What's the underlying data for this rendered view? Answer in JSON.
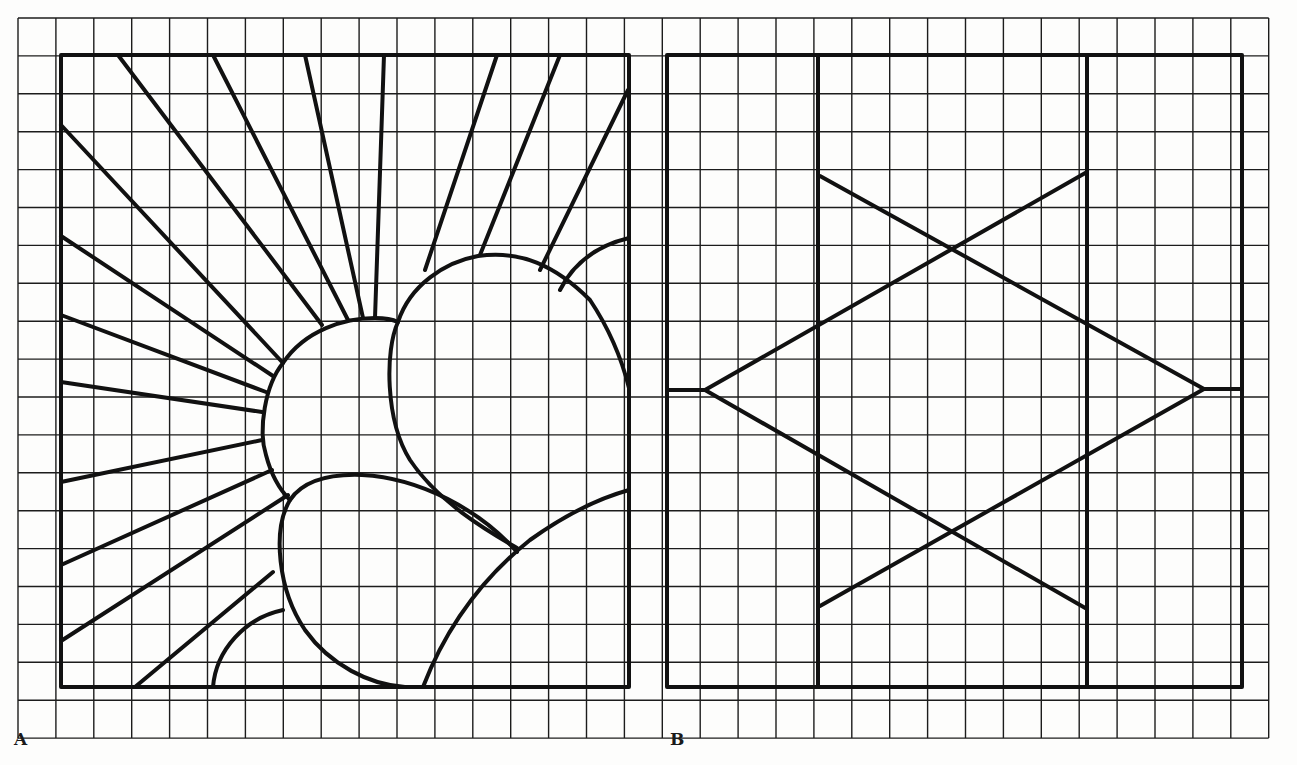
{
  "figure": {
    "colors": {
      "background": "#fdfdfc",
      "grid": "#1c1c1c",
      "lead_line": "#111111"
    },
    "grid": {
      "x0": 18,
      "y0": 18,
      "cell": 37.9,
      "cols": 33,
      "rows": 19
    },
    "panels": [
      {
        "label": "A",
        "label_pos": [
          14,
          743
        ],
        "frame": {
          "x1": 61,
          "y1": 55,
          "x2": 629,
          "y2": 687
        },
        "theme": "sunburst with flowers",
        "rays": [
          [
            [
              118,
              55
            ],
            [
              322,
              325
            ]
          ],
          [
            [
              213,
              55
            ],
            [
              348,
              320
            ]
          ],
          [
            [
              305,
              55
            ],
            [
              363,
              318
            ]
          ],
          [
            [
              384,
              55
            ],
            [
              375,
              318
            ]
          ],
          [
            [
              61,
              125
            ],
            [
              283,
              363
            ]
          ],
          [
            [
              61,
              236
            ],
            [
              273,
              376
            ]
          ],
          [
            [
              61,
              315
            ],
            [
              266,
              392
            ]
          ],
          [
            [
              61,
              382
            ],
            [
              262,
              412
            ]
          ],
          [
            [
              61,
              482
            ],
            [
              262,
              440
            ]
          ],
          [
            [
              61,
              565
            ],
            [
              272,
              470
            ]
          ],
          [
            [
              61,
              641
            ],
            [
              288,
              495
            ]
          ],
          [
            [
              135,
              687
            ],
            [
              273,
              572
            ]
          ],
          [
            [
              497,
              55
            ],
            [
              425,
              270
            ]
          ],
          [
            [
              560,
              55
            ],
            [
              480,
              255
            ]
          ],
          [
            [
              628,
              90
            ],
            [
              540,
              270
            ]
          ]
        ],
        "curves": [
          "M 283 363 C 305 330, 345 318, 375 318 C 390 318, 398 322, 398 322 M 283 363 C 265 385, 258 430, 266 455 C 272 478, 282 492, 290 500",
          "M 398 322 C 385 350, 385 420, 410 460 C 440 505, 495 535, 517 548 M 398 322 C 410 285, 445 262, 478 256 C 520 250, 555 265, 590 300 C 610 330, 622 360, 629 388",
          "M 560 290 C 575 260, 600 245, 629 238",
          "M 290 500 C 305 478, 335 474, 362 475 C 420 478, 480 510, 517 552 M 290 500 C 272 530, 278 590, 305 630 C 330 665, 370 685, 405 687",
          "M 423 687 C 445 630, 480 580, 530 540 C 565 515, 600 498, 629 490",
          "M 213 687 C 216 650, 245 618, 283 610"
        ]
      },
      {
        "label": "B",
        "label_pos": [
          670,
          743
        ],
        "frame": {
          "x1": 667,
          "y1": 55,
          "x2": 1242,
          "y2": 687
        },
        "theme": "six-pointed star between vertical bars",
        "verticals": [
          818,
          1087
        ],
        "star": {
          "left_vertex": [
            705,
            390
          ],
          "right_vertex": [
            1204,
            389
          ],
          "triangle_up_left": [
            [
              705,
              390
            ],
            [
              1087,
              172
            ]
          ],
          "triangle_down_left": [
            [
              705,
              390
            ],
            [
              1087,
              609
            ]
          ],
          "triangle_up_right": [
            [
              1204,
              389
            ],
            [
              820,
              176
            ]
          ],
          "triangle_down_right": [
            [
              1204,
              389
            ],
            [
              820,
              606
            ]
          ],
          "stubs": [
            [
              [
                667,
                390
              ],
              [
                705,
                390
              ]
            ],
            [
              [
                1204,
                389
              ],
              [
                1242,
                389
              ]
            ]
          ]
        }
      }
    ]
  }
}
